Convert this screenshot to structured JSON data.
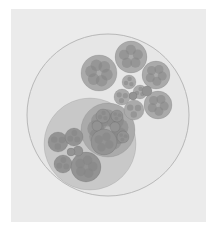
{
  "diagram": {
    "type": "circle-packing",
    "colors": {
      "background": "#ebebeb",
      "root_fill": "#e6e6e6",
      "root_stroke": "#b8b8b8",
      "level1_fill": "#c8c8c8",
      "level2_fill": "#aaaaaa",
      "level3_fill": "#939393",
      "level4_fill": "#858585"
    },
    "root": {
      "cx": 108,
      "cy": 115,
      "r": 81
    },
    "nodes": [
      {
        "id": "bl-group",
        "cx": 90,
        "cy": 144,
        "r": 46,
        "level": 1
      },
      {
        "id": "bl-sub-right",
        "cx": 108,
        "cy": 130,
        "r": 27,
        "level": 2
      },
      {
        "id": "top-1",
        "cx": 131,
        "cy": 57,
        "r": 16,
        "level": 2
      },
      {
        "id": "top-2",
        "cx": 99,
        "cy": 73,
        "r": 18,
        "level": 2
      },
      {
        "id": "top-3",
        "cx": 156,
        "cy": 75,
        "r": 14,
        "level": 2
      },
      {
        "id": "top-4",
        "cx": 158,
        "cy": 105,
        "r": 14,
        "level": 2
      },
      {
        "id": "top-5",
        "cx": 134,
        "cy": 110,
        "r": 10,
        "level": 2
      },
      {
        "id": "top-6",
        "cx": 129,
        "cy": 82,
        "r": 7,
        "level": 2
      },
      {
        "id": "top-7",
        "cx": 140,
        "cy": 92,
        "r": 7,
        "level": 2
      },
      {
        "id": "top-8",
        "cx": 122,
        "cy": 97,
        "r": 8,
        "level": 2
      },
      {
        "id": "top-9",
        "cx": 147,
        "cy": 91,
        "r": 5,
        "level": 3
      },
      {
        "id": "top-10",
        "cx": 133,
        "cy": 96,
        "r": 4,
        "level": 3
      },
      {
        "id": "bl-a",
        "cx": 58,
        "cy": 142,
        "r": 10,
        "level": 3
      },
      {
        "id": "bl-b",
        "cx": 74,
        "cy": 137,
        "r": 9,
        "level": 3
      },
      {
        "id": "bl-c",
        "cx": 63,
        "cy": 164,
        "r": 9,
        "level": 3
      },
      {
        "id": "bl-d",
        "cx": 86,
        "cy": 167,
        "r": 15,
        "level": 3
      },
      {
        "id": "bl-e",
        "cx": 78,
        "cy": 151,
        "r": 5,
        "level": 3
      },
      {
        "id": "bl-f",
        "cx": 71,
        "cy": 152,
        "r": 4,
        "level": 3
      },
      {
        "id": "brs-a",
        "cx": 104,
        "cy": 142,
        "r": 13,
        "level": 3
      },
      {
        "id": "brs-b",
        "cx": 103,
        "cy": 116,
        "r": 7,
        "level": 3
      },
      {
        "id": "brs-c",
        "cx": 117,
        "cy": 116,
        "r": 6,
        "level": 3
      },
      {
        "id": "brs-d",
        "cx": 115,
        "cy": 127,
        "r": 5,
        "level": 3
      },
      {
        "id": "brs-e",
        "cx": 97,
        "cy": 126,
        "r": 5,
        "level": 3
      },
      {
        "id": "brs-f",
        "cx": 123,
        "cy": 137,
        "r": 6,
        "level": 3
      }
    ]
  }
}
